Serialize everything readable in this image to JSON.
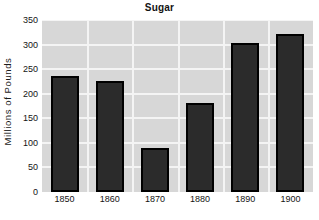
{
  "chart_data": {
    "type": "bar",
    "title": "Sugar",
    "xlabel": "",
    "ylabel": "Millions of Pounds",
    "categories": [
      "1850",
      "1860",
      "1870",
      "1880",
      "1890",
      "1900"
    ],
    "values": [
      237,
      226,
      90,
      181,
      303,
      322
    ],
    "ylim": [
      0,
      350
    ],
    "yticks": [
      0,
      50,
      100,
      150,
      200,
      250,
      300,
      350
    ],
    "ytick_labels": [
      "0",
      "50",
      "100",
      "150",
      "200",
      "250",
      "300",
      "350"
    ],
    "grid": true,
    "legend": null,
    "series": [
      {
        "name": "Sugar",
        "values": [
          237,
          226,
          90,
          181,
          303,
          322
        ]
      }
    ],
    "colors": {
      "bar_fill": "#2b2b2b",
      "bar_edge": "#000000",
      "plot_background": "#d7d7d7",
      "gridline": "#f4f4f4",
      "page_background": "#ffffff",
      "text": "#141414"
    }
  }
}
